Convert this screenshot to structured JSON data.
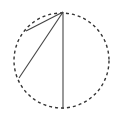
{
  "diagram": {
    "width": 119,
    "height": 125,
    "background": "#ffffff",
    "circle": {
      "cx": 61.5,
      "cy": 60.5,
      "r": 47.5,
      "stroke": "#333333",
      "stroke_width": 1.4,
      "dasharray": "3,3"
    },
    "points": {
      "top": {
        "x": 63,
        "y": 12
      },
      "upper_left": {
        "x": 26,
        "y": 31
      },
      "lower_left": {
        "x": 19,
        "y": 78
      },
      "bottom": {
        "x": 63,
        "y": 109
      }
    },
    "chords": [
      {
        "from": "top",
        "to": "upper_left",
        "stroke": "#444444"
      },
      {
        "from": "top",
        "to": "lower_left",
        "stroke": "#444444"
      },
      {
        "from": "top",
        "to": "bottom",
        "stroke": "#444444"
      }
    ],
    "chord_stroke_width": 1.1
  }
}
